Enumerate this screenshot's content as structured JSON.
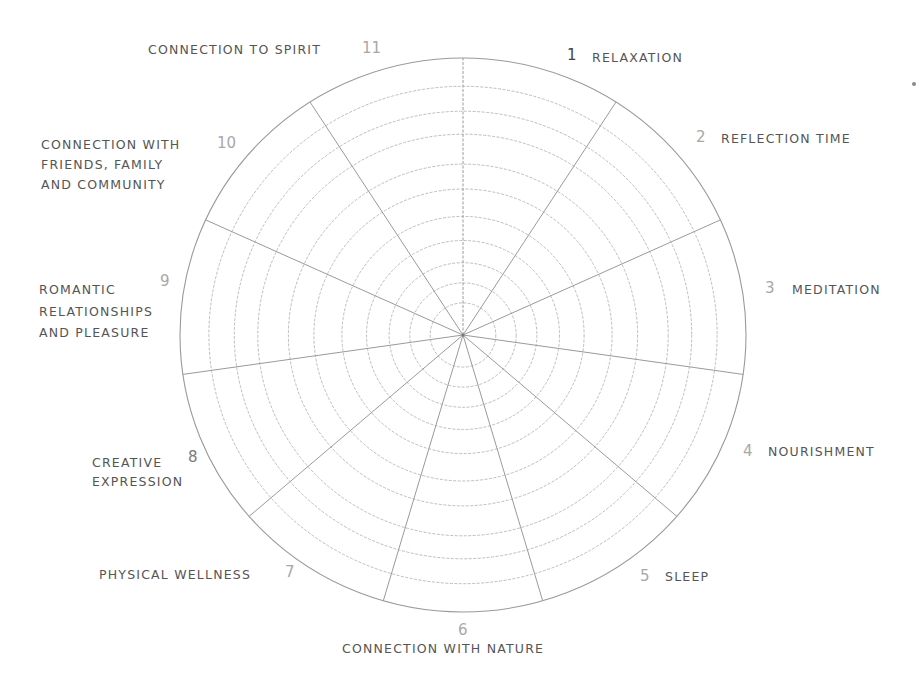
{
  "wheel": {
    "type": "self-care wheel",
    "center": [
      463,
      335
    ],
    "radius_x": 283,
    "radius_y": 277,
    "ring_count": 11,
    "segment_count": 11,
    "line_color": "#b5b5b5",
    "outer_line_color": "#9a9a9a"
  },
  "segments": [
    {
      "number": "1",
      "label": "RELAXATION"
    },
    {
      "number": "2",
      "label": "REFLECTION TIME"
    },
    {
      "number": "3",
      "label": "MEDITATION"
    },
    {
      "number": "4",
      "label": "NOURISHMENT"
    },
    {
      "number": "5",
      "label": "SLEEP"
    },
    {
      "number": "6",
      "label": "CONNECTION WITH NATURE"
    },
    {
      "number": "7",
      "label": "PHYSICAL WELLNESS"
    },
    {
      "number": "8",
      "label_line1": "CREATIVE",
      "label_line2": "EXPRESSION"
    },
    {
      "number": "9",
      "label_line1": "ROMANTIC",
      "label_line2": "RELATIONSHIPS",
      "label_line3": "AND PLEASURE"
    },
    {
      "number": "10",
      "label_line1": "CONNECTION WITH",
      "label_line2": "FRIENDS, FAMILY",
      "label_line3": "AND COMMUNITY"
    },
    {
      "number": "11",
      "label": "CONNECTION TO SPIRIT"
    }
  ]
}
